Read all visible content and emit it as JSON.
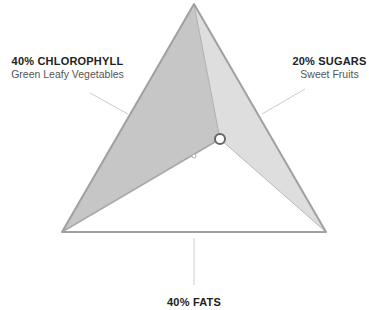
{
  "labels": {
    "chlorophyll": {
      "title": "40% CHLOROPHYLL",
      "subtitle": "Green Leafy Vegetables"
    },
    "sugars": {
      "title": "20% SUGARS",
      "subtitle": "Sweet Fruits"
    },
    "fats": {
      "title": "40% FATS"
    }
  },
  "composition": [
    {
      "name": "Chlorophyll",
      "percent": 40
    },
    {
      "name": "Sugars",
      "percent": 20
    },
    {
      "name": "Fats",
      "percent": 40
    }
  ],
  "colors": {
    "left_face": "#c4c4c4",
    "right_face": "#dcdcdc",
    "bottom_face": "#ffffff",
    "edge": "#a8a8a8",
    "leader_line": "#cccccc"
  }
}
